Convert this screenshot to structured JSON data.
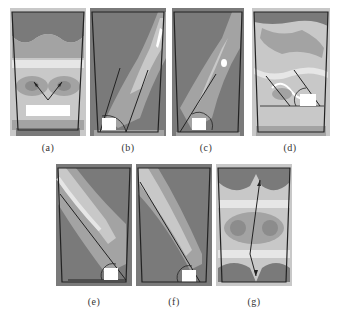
{
  "figure": {
    "panels": [
      {
        "id": "a",
        "label": "(a)"
      },
      {
        "id": "b",
        "label": "(b)"
      },
      {
        "id": "c",
        "label": "(c)"
      },
      {
        "id": "d",
        "label": "(d)"
      },
      {
        "id": "e",
        "label": "(e)"
      },
      {
        "id": "f",
        "label": "(f)"
      },
      {
        "id": "g",
        "label": "(g)"
      }
    ],
    "colors": {
      "dark": "#7a7a7a",
      "mid": "#a3a3a3",
      "light": "#c8c8c8",
      "pale": "#e6e6e6",
      "white": "#ffffff",
      "outline": "#222222"
    }
  }
}
